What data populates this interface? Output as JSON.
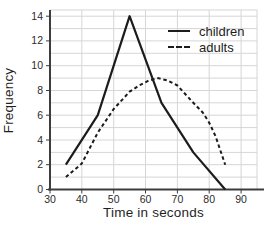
{
  "figure": {
    "background": "#ffffff",
    "plot_background": "#ffffff",
    "grid_color": "#d6d6d6",
    "axis_color": "#3d3d3d",
    "text_color": "#1f1f1f",
    "line_color": "#1c1c1c"
  },
  "chart_data": {
    "type": "line",
    "title": "",
    "xlabel": "Time in seconds",
    "ylabel": "Frequency",
    "xlim": [
      30,
      95
    ],
    "ylim": [
      0,
      14.5
    ],
    "x_ticks": [
      30,
      40,
      50,
      60,
      70,
      80,
      90
    ],
    "y_ticks": [
      0,
      2,
      4,
      6,
      8,
      10,
      12,
      14
    ],
    "x_gridlines": [
      40,
      50,
      60,
      70,
      80,
      90
    ],
    "y_gridline_step": 1,
    "grid": "on",
    "legend_position": "top-right",
    "series": [
      {
        "name": "children",
        "line_style": "solid",
        "color": "#1c1c1c",
        "x": [
          35,
          45,
          55,
          65,
          75,
          85
        ],
        "values": [
          2,
          6,
          14,
          7,
          3,
          0
        ]
      },
      {
        "name": "adults",
        "line_style": "dashed",
        "color": "#1c1c1c",
        "x": [
          35,
          45,
          55,
          65,
          75,
          85
        ],
        "values": [
          1,
          5,
          8,
          9,
          7,
          2
        ],
        "drawn_curve_points": [
          [
            35,
            1
          ],
          [
            40,
            2.1
          ],
          [
            45,
            4.6
          ],
          [
            50,
            6.5
          ],
          [
            55,
            7.9
          ],
          [
            58,
            8.4
          ],
          [
            61,
            8.8
          ],
          [
            64,
            9
          ],
          [
            67,
            8.8
          ],
          [
            70,
            8.4
          ],
          [
            75,
            7
          ],
          [
            78,
            6.2
          ],
          [
            80,
            5.4
          ],
          [
            82,
            4.3
          ],
          [
            85,
            2
          ]
        ]
      }
    ]
  }
}
